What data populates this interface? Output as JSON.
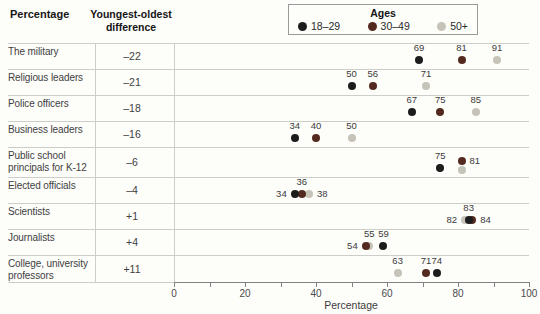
{
  "figure": {
    "background": "#fdfdfa",
    "header": {
      "col1": "Percentage",
      "col2": "Youngest-oldest difference"
    },
    "xlabel": "Percentage"
  },
  "legend": {
    "title": "Ages",
    "entries": [
      {
        "age": "18-29",
        "label": "18–29",
        "color": "#1c1c1c"
      },
      {
        "age": "30-49",
        "label": "30–49",
        "color": "#54291f"
      },
      {
        "age": "50+",
        "label": "50+",
        "color": "#c6c3b8"
      }
    ]
  },
  "chart_data": {
    "type": "scatter",
    "title": "",
    "xlabel": "Percentage",
    "xlim": [
      0,
      100
    ],
    "x_major_ticks": [
      0,
      20,
      40,
      60,
      80,
      100
    ],
    "x_minor_step": 10,
    "legend_position": "top-right",
    "grid": "row-separators",
    "rows": [
      {
        "category": "The military",
        "difference": "–22",
        "values": {
          "18-29": 69,
          "30-49": 81,
          "50+": 91
        },
        "points": [
          {
            "age": "18-29",
            "value": 69,
            "label": "69",
            "label_pos": "above"
          },
          {
            "age": "30-49",
            "value": 81,
            "label": "81",
            "label_pos": "above"
          },
          {
            "age": "50+",
            "value": 91,
            "label": "91",
            "label_pos": "above"
          }
        ]
      },
      {
        "category": "Religious leaders",
        "difference": "–21",
        "values": {
          "18-29": 50,
          "30-49": 56,
          "50+": 71
        },
        "points": [
          {
            "age": "18-29",
            "value": 50,
            "label": "50",
            "label_pos": "above"
          },
          {
            "age": "30-49",
            "value": 56,
            "label": "56",
            "label_pos": "above"
          },
          {
            "age": "50+",
            "value": 71,
            "label": "71",
            "label_pos": "above"
          }
        ]
      },
      {
        "category": "Police officers",
        "difference": "–18",
        "values": {
          "18-29": 67,
          "30-49": 75,
          "50+": 85
        },
        "points": [
          {
            "age": "18-29",
            "value": 67,
            "label": "67",
            "label_pos": "above"
          },
          {
            "age": "30-49",
            "value": 75,
            "label": "75",
            "label_pos": "above"
          },
          {
            "age": "50+",
            "value": 85,
            "label": "85",
            "label_pos": "above"
          }
        ]
      },
      {
        "category": "Business leaders",
        "difference": "–16",
        "values": {
          "18-29": 34,
          "30-49": 40,
          "50+": 50
        },
        "points": [
          {
            "age": "18-29",
            "value": 34,
            "label": "34",
            "label_pos": "above"
          },
          {
            "age": "30-49",
            "value": 40,
            "label": "40",
            "label_pos": "above"
          },
          {
            "age": "50+",
            "value": 50,
            "label": "50",
            "label_pos": "above"
          }
        ]
      },
      {
        "category": "Public school principals for K-12",
        "difference": "–6",
        "row_height": 30,
        "values": {
          "18-29": 75,
          "30-49": 81,
          "50+": 81
        },
        "points": [
          {
            "age": "50+",
            "value": 81,
            "dy": 2
          },
          {
            "age": "30-49",
            "value": 81,
            "dy": -7,
            "label": "81",
            "label_pos": "right"
          },
          {
            "age": "18-29",
            "value": 75,
            "label": "75",
            "label_pos": "above"
          }
        ]
      },
      {
        "category": "Elected officials",
        "difference": "–4",
        "values": {
          "18-29": 34,
          "30-49": 36,
          "50+": 38
        },
        "points": [
          {
            "age": "50+",
            "value": 38,
            "label": "38",
            "label_pos": "right"
          },
          {
            "age": "30-49",
            "value": 36,
            "label": "36",
            "label_pos": "above"
          },
          {
            "age": "18-29",
            "value": 34,
            "label": "34",
            "label_pos": "left"
          }
        ]
      },
      {
        "category": "Scientists",
        "difference": "+1",
        "values": {
          "18-29": 83,
          "30-49": 84,
          "50+": 82
        },
        "points": [
          {
            "age": "50+",
            "value": 82,
            "label": "82",
            "label_pos": "left"
          },
          {
            "age": "30-49",
            "value": 84,
            "label": "84",
            "label_pos": "right"
          },
          {
            "age": "18-29",
            "value": 83,
            "label": "83",
            "label_pos": "above"
          }
        ]
      },
      {
        "category": "Journalists",
        "difference": "+4",
        "values": {
          "18-29": 59,
          "30-49": 54,
          "50+": 55
        },
        "points": [
          {
            "age": "50+",
            "value": 55,
            "label": "55",
            "label_pos": "above"
          },
          {
            "age": "30-49",
            "value": 54,
            "label": "54",
            "label_pos": "left"
          },
          {
            "age": "18-29",
            "value": 59,
            "label": "59",
            "label_pos": "above"
          }
        ]
      },
      {
        "category": "College, university professors",
        "difference": "+11",
        "row_height": 27,
        "values": {
          "18-29": 74,
          "30-49": 71,
          "50+": 63
        },
        "points": [
          {
            "age": "50+",
            "value": 63,
            "label": "63",
            "label_pos": "above"
          },
          {
            "age": "30-49",
            "value": 71,
            "label": "71",
            "label_pos": "above"
          },
          {
            "age": "18-29",
            "value": 74,
            "label": "74",
            "label_pos": "above"
          }
        ]
      }
    ]
  }
}
